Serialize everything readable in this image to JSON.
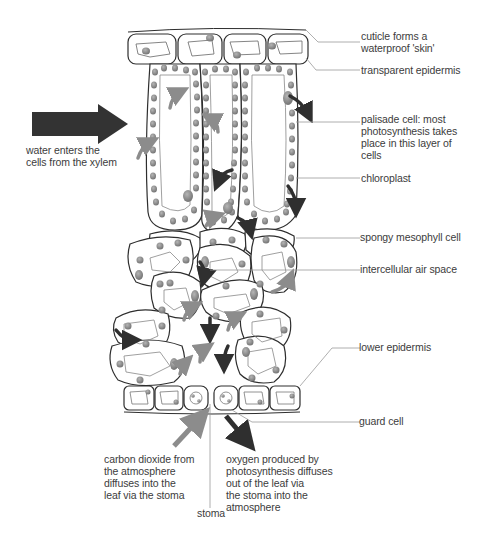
{
  "diagram": {
    "labels": {
      "cuticle": "cuticle forms a\nwaterproof 'skin'",
      "transparent_epidermis": "transparent epidermis",
      "palisade_cell": "palisade cell: most\nphotosynthesis takes\nplace in this layer of\ncells",
      "chloroplast": "chloroplast",
      "spongy_mesophyll": "spongy mesophyll cell",
      "intercellular_air_space": "intercellular air space",
      "lower_epidermis": "lower epidermis",
      "guard_cell": "guard cell",
      "water_enters": "water enters the\ncells from the xylem",
      "carbon_dioxide": "carbon dioxide from\nthe atmosphere\ndiffuses into the\nleaf via the stoma",
      "oxygen": "oxygen produced by\nphotosynthesis diffuses\nout of the leaf via\nthe stoma into the\natmosphere",
      "stoma": "stoma"
    },
    "colors": {
      "outline": "#2e2e2e",
      "chloroplast_fill": "#8a8a8a",
      "arrow_dark": "#2f2f2f",
      "arrow_light": "#8c8c8c",
      "leader_line": "#9a9a9a"
    }
  }
}
